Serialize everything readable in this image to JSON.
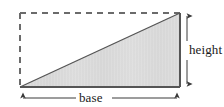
{
  "figure": {
    "name": "right-triangle-base-height-diagram",
    "type": "geometry-diagram",
    "shape": "right triangle inscribed in dashed rectangle",
    "background_color": "#ffffff",
    "labels": {
      "height": "height",
      "base": "base"
    },
    "colors": {
      "fill": "#d9d9d9",
      "fill_highlight": "#e4e4e4",
      "outline": "#555555",
      "dashed_outline": "#6b6b6b",
      "arrow": "#3a3a3a",
      "text": "#1a1a1a"
    },
    "geometry": {
      "rect_left_x": 20,
      "rect_right_x": 180,
      "rect_top_y": 13,
      "rect_bottom_y": 87,
      "triangle_vertices": [
        [
          20,
          87
        ],
        [
          180,
          87
        ],
        [
          180,
          13
        ]
      ],
      "base_length_px": 160,
      "height_length_px": 74
    },
    "dimension_arrows": {
      "height_arrow": {
        "orientation": "vertical",
        "x": 187,
        "y_start": 13,
        "y_end": 87,
        "double_headed": true,
        "label": "height"
      },
      "base_arrow": {
        "orientation": "horizontal",
        "y": 98,
        "x_start": 20,
        "x_end": 180,
        "double_headed": true,
        "label": "base"
      }
    },
    "dash_pattern": "6 5"
  }
}
